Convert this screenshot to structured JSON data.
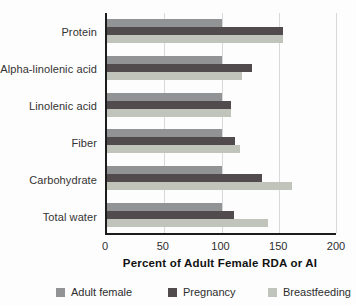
{
  "chart_data": {
    "type": "bar",
    "orientation": "horizontal",
    "title": "",
    "xlabel": "Percent of Adult Female RDA or AI",
    "ylabel": "",
    "xlim": [
      0,
      200
    ],
    "xticks": [
      0,
      50,
      100,
      150,
      200
    ],
    "grid": true,
    "legend_position": "bottom",
    "categories": [
      "Protein",
      "Alpha-linolenic acid",
      "Linolenic acid",
      "Fiber",
      "Carbohydrate",
      "Total water"
    ],
    "series": [
      {
        "name": "Adult female",
        "color": "#919395",
        "values": [
          100,
          100,
          100,
          100,
          100,
          100
        ]
      },
      {
        "name": "Pregnancy",
        "color": "#514b4d",
        "values": [
          154,
          127,
          108,
          112,
          135,
          111
        ]
      },
      {
        "name": "Breastfeeding",
        "color": "#c0c4ba",
        "values": [
          154,
          118,
          108,
          116,
          162,
          141
        ]
      }
    ]
  }
}
